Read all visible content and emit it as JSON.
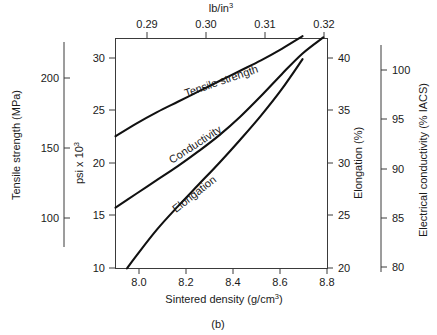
{
  "figure": {
    "caption": "(b)"
  },
  "chart_data": {
    "type": "line",
    "title": "",
    "xlabel": "Sintered density (g/cm",
    "xlabel_sup": "3",
    "xlabel_tail": ")",
    "top_axis_label": "lb/in",
    "top_axis_label_sup": "3",
    "grid": false,
    "legend": "inline-curve-labels",
    "axes": {
      "x_bottom": {
        "name": "Sintered density (g/cm3)",
        "min": 7.9,
        "max": 8.92,
        "ticks": [
          "8.0",
          "8.2",
          "8.4",
          "8.6",
          "8.8"
        ],
        "tick_values": [
          8.0,
          8.2,
          8.4,
          8.6,
          8.8
        ]
      },
      "x_top": {
        "name": "lb/in3",
        "min": 0.2855,
        "max": 0.3222,
        "ticks": [
          "0.29",
          "0.30",
          "0.31",
          "0.32"
        ],
        "tick_values": [
          0.29,
          0.3,
          0.31,
          0.32
        ]
      },
      "y_far_left": {
        "name": "Tensile strength (MPa)",
        "min": 69,
        "max": 210,
        "ticks": [
          "200",
          "150",
          "100"
        ],
        "tick_values": [
          200,
          150,
          100
        ]
      },
      "y_left": {
        "name": "psi x 10",
        "name_sup": "3",
        "min": 10,
        "max": 30,
        "ticks": [
          "30",
          "25",
          "20",
          "15",
          "10"
        ],
        "tick_values": [
          30,
          25,
          20,
          15,
          10
        ]
      },
      "y_right": {
        "name": "Elongation (%)",
        "min": 20,
        "max": 40,
        "ticks": [
          "40",
          "35",
          "30",
          "25",
          "20"
        ],
        "tick_values": [
          40,
          35,
          30,
          25,
          20
        ]
      },
      "y_far_right": {
        "name": "Electrical conductivity (% IACS)",
        "min": 79,
        "max": 101,
        "ticks": [
          "100",
          "95",
          "90",
          "85",
          "80"
        ],
        "tick_values": [
          100,
          95,
          90,
          85,
          80
        ]
      }
    },
    "series": [
      {
        "name": "Tensile strength",
        "label": "Tensile strength",
        "y_axis": "psi x 10^3",
        "x": [
          7.9,
          8.0,
          8.1,
          8.2,
          8.3,
          8.4,
          8.5,
          8.6,
          8.7,
          8.8
        ],
        "values": [
          21.5,
          22.6,
          23.6,
          24.5,
          25.4,
          26.3,
          27.2,
          28.1,
          29.1,
          30.2
        ]
      },
      {
        "name": "Conductivity",
        "label": "Conductivity",
        "y_axis": "psi x 10^3 (mapped to % IACS)",
        "x": [
          7.9,
          8.0,
          8.1,
          8.2,
          8.3,
          8.4,
          8.5,
          8.6,
          8.7,
          8.8,
          8.9
        ],
        "values": [
          15.3,
          16.5,
          17.7,
          18.9,
          20.2,
          21.6,
          23.2,
          25.0,
          26.9,
          28.7,
          30.1
        ]
      },
      {
        "name": "Elongation",
        "label": "Elongation",
        "y_axis": "psi x 10^3 (mapped to %)",
        "x": [
          7.955,
          8.0,
          8.1,
          8.2,
          8.3,
          8.4,
          8.5,
          8.6,
          8.7,
          8.8
        ],
        "values": [
          10.0,
          11.1,
          13.4,
          15.4,
          17.3,
          19.2,
          21.2,
          23.3,
          25.6,
          28.2
        ]
      }
    ]
  }
}
